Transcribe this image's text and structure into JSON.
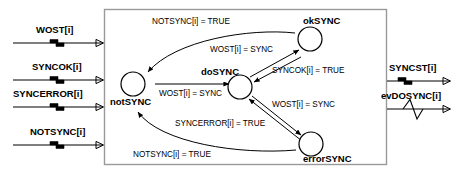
{
  "diagram": {
    "colors": {
      "stroke": "#000000",
      "box_border": "#9a9a9a",
      "background": "#ffffff"
    },
    "inputs": [
      {
        "label": "WOST[i]",
        "glyph": "step-signal-icon"
      },
      {
        "label": "SYNCOK[i]",
        "glyph": "step-signal-icon"
      },
      {
        "label": "SYNCERROR[i]",
        "glyph": "step-signal-icon"
      },
      {
        "label": "NOTSYNC[i]",
        "glyph": "step-signal-icon"
      }
    ],
    "outputs": [
      {
        "label": "SYNCST[i]",
        "glyph": "step-signal-icon"
      },
      {
        "label": "evDOSYNC[i]",
        "glyph": "pulse-signal-icon"
      }
    ],
    "states": [
      {
        "id": "notSYNC",
        "label": "notSYNC"
      },
      {
        "id": "doSYNC",
        "label": "doSYNC"
      },
      {
        "id": "okSYNC",
        "label": "okSYNC"
      },
      {
        "id": "errorSYNC",
        "label": "errorSYNC"
      }
    ],
    "transitions": [
      {
        "id": "t1",
        "from": "notSYNC",
        "to": "doSYNC",
        "label": "WOST[i] = SYNC"
      },
      {
        "id": "t2",
        "from": "doSYNC",
        "to": "okSYNC",
        "label": "WOST[i] = SYNC"
      },
      {
        "id": "t3",
        "from": "okSYNC",
        "to": "doSYNC",
        "label": "SYNCOK[i] = TRUE"
      },
      {
        "id": "t4",
        "from": "doSYNC",
        "to": "errorSYNC",
        "label": "WOST[i] = SYNC"
      },
      {
        "id": "t5",
        "from": "errorSYNC",
        "to": "doSYNC",
        "label": "SYNCERROR[i] = TRUE"
      },
      {
        "id": "t6",
        "from": "okSYNC",
        "to": "notSYNC",
        "label": "NOTSYNC[i] = TRUE"
      },
      {
        "id": "t7",
        "from": "errorSYNC",
        "to": "notSYNC",
        "label": "NOTSYNC[i] = TRUE"
      }
    ]
  }
}
